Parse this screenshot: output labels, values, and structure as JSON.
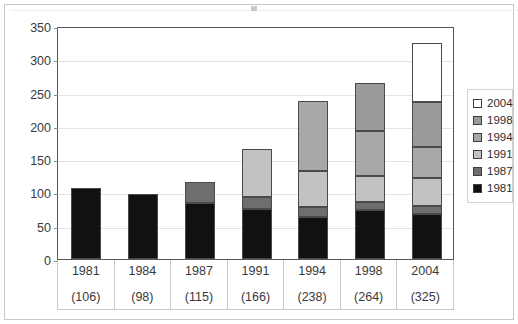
{
  "chart_data": {
    "type": "bar",
    "stacked": true,
    "title": "",
    "subtitle": "",
    "xlabel": "",
    "ylabel": "",
    "categories": [
      "1981",
      "1984",
      "1987",
      "1991",
      "1994",
      "1998",
      "2004"
    ],
    "category_totals": [
      "(106)",
      "(98)",
      "(115)",
      "(166)",
      "(238)",
      "(264)",
      "(325)"
    ],
    "totals": [
      106,
      98,
      115,
      166,
      238,
      264,
      325
    ],
    "series": [
      {
        "name": "1981",
        "color": "#111111",
        "values": [
          106,
          98,
          84,
          75,
          63,
          73,
          68
        ]
      },
      {
        "name": "1987",
        "color": "#6e6e6e",
        "values": [
          0,
          0,
          31,
          18,
          15,
          12,
          12
        ]
      },
      {
        "name": "1991",
        "color": "#c2c2c2",
        "values": [
          0,
          0,
          0,
          73,
          54,
          40,
          42
        ]
      },
      {
        "name": "1994",
        "color": "#a8a8a8",
        "values": [
          0,
          0,
          0,
          0,
          106,
          68,
          46
        ]
      },
      {
        "name": "1998",
        "color": "#9a9a9a",
        "values": [
          0,
          0,
          0,
          0,
          0,
          71,
          68
        ]
      },
      {
        "name": "2004",
        "color": "#ffffff",
        "values": [
          0,
          0,
          0,
          0,
          0,
          0,
          89
        ]
      }
    ],
    "legend": [
      {
        "label": "2004",
        "color": "#ffffff"
      },
      {
        "label": "1998",
        "color": "#9a9a9a"
      },
      {
        "label": "1994",
        "color": "#a8a8a8"
      },
      {
        "label": "1991",
        "color": "#c2c2c2"
      },
      {
        "label": "1987",
        "color": "#6e6e6e"
      },
      {
        "label": "1981",
        "color": "#111111"
      }
    ],
    "legend_position": "right",
    "ylim": [
      0,
      350
    ],
    "yticks": [
      0,
      50,
      100,
      150,
      200,
      250,
      300,
      350
    ],
    "ytick_labels": [
      "0",
      "50",
      "100",
      "150",
      "200",
      "250",
      "300",
      "350"
    ],
    "grid": true,
    "grid_axis": "y"
  }
}
